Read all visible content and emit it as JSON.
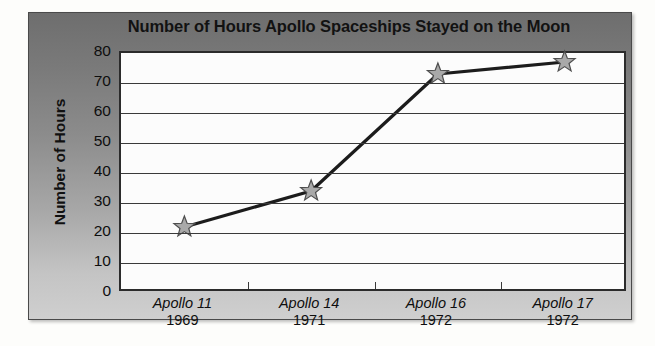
{
  "chart_data": {
    "type": "line",
    "title": "Number of Hours Apollo Spaceships Stayed on the Moon",
    "xlabel": "",
    "ylabel": "Number of Hours",
    "categories": [
      "Apollo 11",
      "Apollo 14",
      "Apollo 16",
      "Apollo 17"
    ],
    "category_sublabels": [
      "1969",
      "1971",
      "1972",
      "1972"
    ],
    "values": [
      22,
      34,
      73,
      77
    ],
    "ylim": [
      0,
      80
    ],
    "ytick_values": [
      0,
      10,
      20,
      30,
      40,
      50,
      60,
      70,
      80
    ],
    "ytick_labels": [
      "0",
      "10",
      "20",
      "30",
      "40",
      "50",
      "60",
      "70",
      "80"
    ],
    "grid": "horizontal",
    "legend": "none",
    "marker": "star",
    "marker_color": "#a9a9a9",
    "marker_edge_color": "#4d4d4d",
    "line_color": "#1c1c1c",
    "plot_background": "#fcfcfc",
    "panel_gradient_top": "#6e6e6e",
    "panel_gradient_bottom": "#cfcfcf"
  },
  "figure": {
    "title": "Number of Hours Apollo Spaceships Stayed on the Moon",
    "y_axis_title": "Number of Hours"
  }
}
